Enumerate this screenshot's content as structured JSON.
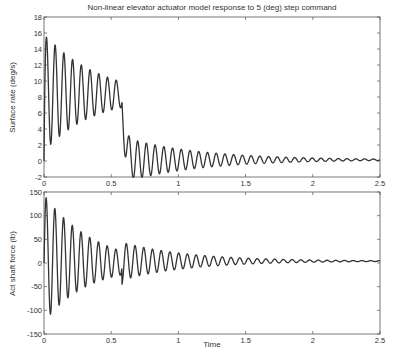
{
  "figure": {
    "title": "Non-linear elevator actuator model response to 5 (deg) step command",
    "xlabel": "Time"
  },
  "chart_data": [
    {
      "type": "line",
      "title": "Non-linear elevator actuator model response to 5 (deg) step command",
      "xlabel": "",
      "ylabel": "Surface rate (deg/s)",
      "xlim": [
        0,
        2.5
      ],
      "ylim": [
        -2,
        18
      ],
      "xticks": [
        0,
        0.5,
        1,
        1.5,
        2,
        2.5
      ],
      "xtick_labels": [
        "0",
        "0.5",
        "1",
        "1.5",
        "2",
        "2.5"
      ],
      "yticks": [
        -2,
        0,
        2,
        4,
        6,
        8,
        10,
        12,
        14,
        16,
        18
      ],
      "ytick_labels": [
        "-2",
        "0",
        "2",
        "4",
        "6",
        "8",
        "10",
        "12",
        "14",
        "16",
        "18"
      ],
      "grid": false,
      "legend": null,
      "series": [
        {
          "name": "Surface rate",
          "color": "#333333",
          "description": "Damped ~15 Hz oscillation; saturated-rate phase to t~0.58 s then drop and decay to ~0.1",
          "peaks": [
            [
              0.035,
              16.0
            ],
            [
              0.1,
              14.5
            ],
            [
              0.165,
              13.4
            ],
            [
              0.23,
              12.5
            ],
            [
              0.295,
              11.8
            ],
            [
              0.36,
              11.1
            ],
            [
              0.425,
              10.6
            ],
            [
              0.49,
              10.1
            ],
            [
              0.555,
              9.9
            ]
          ],
          "troughs": [
            [
              0.068,
              1.4
            ],
            [
              0.133,
              2.6
            ],
            [
              0.198,
              3.7
            ],
            [
              0.263,
              4.6
            ],
            [
              0.328,
              5.3
            ],
            [
              0.393,
              5.9
            ],
            [
              0.458,
              6.4
            ],
            [
              0.523,
              6.8
            ]
          ],
          "post_drop_peaks": [
            [
              0.66,
              4.3
            ],
            [
              0.73,
              2.6
            ],
            [
              0.8,
              1.9
            ],
            [
              0.86,
              1.6
            ],
            [
              1.0,
              1.1
            ],
            [
              1.5,
              0.5
            ],
            [
              2.0,
              0.25
            ],
            [
              2.5,
              0.2
            ]
          ],
          "post_drop_troughs": [
            [
              0.63,
              0.6
            ],
            [
              0.7,
              -1.2
            ],
            [
              0.76,
              -1.6
            ],
            [
              0.83,
              -1.4
            ],
            [
              1.0,
              -0.9
            ],
            [
              1.5,
              -0.3
            ],
            [
              2.0,
              0.0
            ],
            [
              2.5,
              0.1
            ]
          ],
          "model": {
            "phase1": {
              "t_end": 0.58,
              "mean_start": 8.6,
              "mean_end": 8.3,
              "amp_start": 7.4,
              "amp_end": 1.6,
              "freq_hz": 15.4
            },
            "phase2": {
              "mean": 0.15,
              "amp_start": 2.9,
              "decay": 1.8,
              "freq_hz": 15.4
            }
          }
        }
      ]
    },
    {
      "type": "line",
      "xlabel": "Time",
      "ylabel": "Act shaft force (lb)",
      "xlim": [
        0,
        2.5
      ],
      "ylim": [
        -150,
        150
      ],
      "xticks": [
        0,
        0.5,
        1,
        1.5,
        2,
        2.5
      ],
      "xtick_labels": [
        "0",
        "0.5",
        "1",
        "1.5",
        "2",
        "2.5"
      ],
      "yticks": [
        -150,
        -100,
        -50,
        0,
        50,
        100,
        150
      ],
      "ytick_labels": [
        "-150",
        "-100",
        "-50",
        "0",
        "50",
        "100",
        "150"
      ],
      "grid": false,
      "legend": null,
      "series": [
        {
          "name": "Act shaft force",
          "color": "#333333",
          "description": "Damped ~15 Hz oscillation about ~0 lb, disturbance near t~0.58 s, decays to ~5 lb",
          "peaks": [
            [
              0.03,
              145
            ],
            [
              0.1,
              120
            ],
            [
              0.165,
              100
            ],
            [
              0.23,
              83
            ],
            [
              0.295,
              68
            ],
            [
              0.36,
              55
            ],
            [
              0.425,
              45
            ],
            [
              0.49,
              38
            ],
            [
              0.555,
              35
            ],
            [
              0.65,
              40
            ],
            [
              1.0,
              20
            ],
            [
              1.5,
              10
            ],
            [
              2.0,
              7
            ],
            [
              2.5,
              5
            ]
          ],
          "troughs": [
            [
              0.065,
              -115
            ],
            [
              0.13,
              -90
            ],
            [
              0.195,
              -72
            ],
            [
              0.26,
              -57
            ],
            [
              0.325,
              -45
            ],
            [
              0.39,
              -35
            ],
            [
              0.455,
              -27
            ],
            [
              0.52,
              -20
            ],
            [
              0.6,
              -45
            ],
            [
              0.68,
              -35
            ],
            [
              1.0,
              -5
            ],
            [
              1.5,
              0
            ],
            [
              2.0,
              2
            ],
            [
              2.5,
              4
            ]
          ],
          "model": {
            "phase1": {
              "t_end": 0.58,
              "mean": 10,
              "amp_start": 135,
              "decay": 2.9,
              "freq_hz": 15.4
            },
            "phase2": {
              "mean": 4,
              "amp_start": 40,
              "decay": 2.0,
              "freq_hz": 15.4
            }
          }
        }
      ]
    }
  ]
}
